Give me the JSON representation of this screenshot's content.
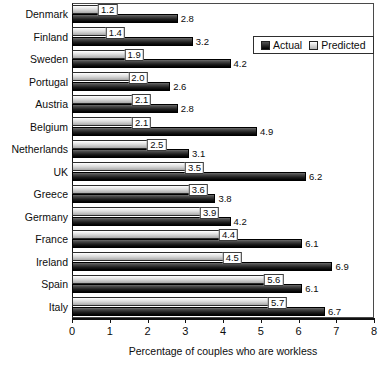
{
  "chart_data": {
    "type": "bar",
    "orientation": "horizontal",
    "title": "",
    "xlabel": "Percentage of couples who are workless",
    "ylabel": "",
    "xlim": [
      0,
      8
    ],
    "xticks": [
      0,
      1,
      2,
      3,
      4,
      5,
      6,
      7,
      8
    ],
    "grid": false,
    "legend_position": "top-right",
    "categories": [
      "Denmark",
      "Finland",
      "Sweden",
      "Portugal",
      "Austria",
      "Belgium",
      "Netherlands",
      "UK",
      "Greece",
      "Germany",
      "France",
      "Ireland",
      "Spain",
      "Italy"
    ],
    "series": [
      {
        "name": "Predicted",
        "color": "#d6d6d6",
        "values": [
          1.2,
          1.4,
          1.9,
          2.0,
          2.1,
          2.1,
          2.5,
          3.5,
          3.6,
          3.9,
          4.4,
          4.5,
          5.6,
          5.7
        ],
        "labels": [
          "1.2",
          "1.4",
          "1.9",
          "2.0",
          "2.1",
          "2.1",
          "2.5",
          "3.5",
          "3.6",
          "3.9",
          "4.4",
          "4.5",
          "5.6",
          "5.7"
        ]
      },
      {
        "name": "Actual",
        "color": "#111111",
        "values": [
          2.8,
          3.2,
          4.2,
          2.6,
          2.8,
          4.9,
          3.1,
          6.2,
          3.8,
          4.2,
          6.1,
          6.9,
          6.1,
          6.7
        ],
        "labels": [
          "2.8",
          "3.2",
          "4.2",
          "2.6",
          "2.8",
          "4.9",
          "3.1",
          "6.2",
          "3.8",
          "4.2",
          "6.1",
          "6.9",
          "6.1",
          "6.7"
        ]
      }
    ]
  },
  "legend": {
    "entries": [
      {
        "label": "Actual",
        "swatch": "actual-swatch"
      },
      {
        "label": "Predicted",
        "swatch": "predicted-swatch"
      }
    ]
  }
}
